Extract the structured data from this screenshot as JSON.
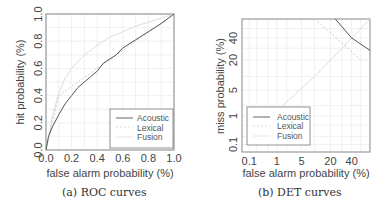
{
  "chart_data": [
    {
      "type": "line",
      "title": "ROC curves",
      "caption": "(a) ROC curves",
      "xlabel": "false alarm probability (%)",
      "ylabel": "hit probability (%)",
      "xlim": [
        0,
        1
      ],
      "ylim": [
        0,
        1
      ],
      "xticks": [
        "0.0",
        "0.2",
        "0.4",
        "0.6",
        "0.8",
        "1.0"
      ],
      "yticks": [
        "0.0",
        "0.2",
        "0.4",
        "0.6",
        "0.8",
        "1.0"
      ],
      "grid": true,
      "legend_position": "lower right",
      "legend": [
        "Acoustic",
        "Lexical",
        "Fusion"
      ],
      "series": [
        {
          "name": "Acoustic",
          "color": "#555555",
          "x": [
            0,
            0.02,
            0.05,
            0.1,
            0.15,
            0.2,
            0.25,
            0.3,
            0.35,
            0.4,
            0.45,
            0.5,
            0.55,
            0.6,
            0.7,
            0.8,
            0.9,
            1.0
          ],
          "y": [
            0,
            0.1,
            0.17,
            0.26,
            0.34,
            0.4,
            0.46,
            0.5,
            0.54,
            0.58,
            0.64,
            0.67,
            0.7,
            0.75,
            0.81,
            0.87,
            0.93,
            1.0
          ]
        },
        {
          "name": "Lexical",
          "color": "#cccccc",
          "x": [
            0,
            0.1,
            0.1,
            1.0
          ],
          "y": [
            0,
            0.4,
            0.4,
            1.0
          ]
        },
        {
          "name": "Fusion",
          "color": "#dddddd",
          "x": [
            0,
            0.05,
            0.1,
            0.15,
            0.2,
            0.3,
            0.4,
            0.5,
            0.6,
            0.7,
            0.8,
            0.9,
            1.0
          ],
          "y": [
            0,
            0.25,
            0.42,
            0.53,
            0.6,
            0.7,
            0.77,
            0.83,
            0.87,
            0.91,
            0.94,
            0.97,
            1.0
          ]
        }
      ]
    },
    {
      "type": "line",
      "title": "DET curves",
      "caption": "(b) DET curves",
      "xlabel": "false alarm probability (%)",
      "ylabel": "miss probability (%)",
      "xticks": [
        "0.1",
        "1",
        "5",
        "20",
        "40"
      ],
      "yticks": [
        "0.1",
        "1",
        "5",
        "20",
        "40"
      ],
      "grid": true,
      "legend_position": "lower left",
      "legend": [
        "Acoustic",
        "Lexical",
        "Fusion"
      ],
      "series": [
        {
          "name": "Acoustic",
          "color": "#555555",
          "x": [
            24,
            40,
            60
          ],
          "y": [
            60,
            40,
            28
          ]
        },
        {
          "name": "Lexical",
          "color": "#cccccc",
          "x": [
            10,
            30,
            50
          ],
          "y": [
            60,
            35,
            20
          ]
        },
        {
          "name": "Fusion",
          "color": "#dddddd",
          "x": [
            1.5,
            10,
            40,
            60
          ],
          "y": [
            2,
            10,
            40,
            60
          ]
        }
      ]
    }
  ],
  "captions": {
    "a": "(a) ROC curves",
    "b": "(b) DET curves"
  }
}
